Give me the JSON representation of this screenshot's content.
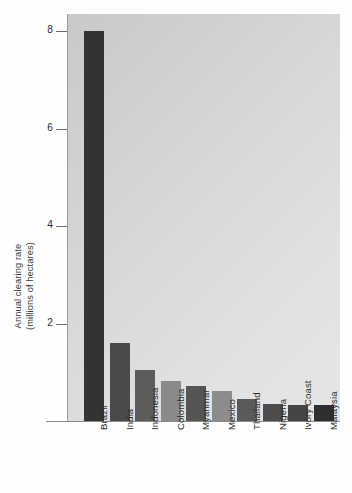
{
  "chart_data": {
    "type": "bar",
    "title": "",
    "xlabel": "",
    "ylabel": "Annual clearing rate (millions of hectares)",
    "ylabel_line1": "Annual clearing rate",
    "ylabel_line2": "(millions of hectares)",
    "categories": [
      "Brazil",
      "India",
      "Indonesia",
      "Colombia",
      "Myanmar",
      "Mexico",
      "Thailand",
      "Nigeria",
      "Ivory Coast",
      "Malaysia"
    ],
    "values": [
      8.0,
      1.6,
      1.05,
      0.82,
      0.72,
      0.62,
      0.45,
      0.35,
      0.33,
      0.32
    ],
    "bar_colors": [
      "#333333",
      "#4a4a4a",
      "#5c5c5c",
      "#8a8a8a",
      "#555555",
      "#8c8c8c",
      "#5a5a5a",
      "#4c4c4c",
      "#454545",
      "#2f2f2f"
    ],
    "ylim": [
      0,
      8.6
    ],
    "yticks": [
      2,
      4,
      6,
      8
    ],
    "ytick_labels": [
      "2",
      "4",
      "6",
      "8"
    ],
    "grid": false,
    "legend": null,
    "plot_background": "#d8d8d8"
  }
}
